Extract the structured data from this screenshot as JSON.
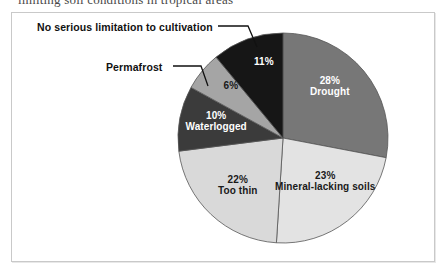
{
  "caption": {
    "cut_off_line": "limiting soil conditions in tropical areas"
  },
  "chart_data": {
    "type": "pie",
    "title": "",
    "subtitle": "",
    "xlabel": "",
    "ylabel": "",
    "legend_position": "none",
    "grid": false,
    "units": "percent",
    "start_angle_deg": 0,
    "direction": "clockwise",
    "categories": [
      "Drought",
      "Mineral-lacking soils",
      "Too thin",
      "Waterlogged",
      "Permafrost",
      "No serious limitation to cultivation"
    ],
    "values": [
      28,
      23,
      22,
      10,
      6,
      11
    ],
    "slices": [
      {
        "name": "Drought",
        "value": 28,
        "percent_text": "28%",
        "label_text": "Drought",
        "label_placement": "inside",
        "text_color": "on-dark",
        "color": "#777777",
        "label_x": 330,
        "label_y": 86
      },
      {
        "name": "Mineral-lacking soils",
        "value": 23,
        "percent_text": "23%",
        "label_text": "Mineral-lacking soils",
        "label_placement": "inside",
        "text_color": "on-light",
        "color": "#e3e3e3",
        "label_x": 325,
        "label_y": 181
      },
      {
        "name": "Too thin",
        "value": 22,
        "percent_text": "22%",
        "label_text": "Too thin",
        "label_placement": "inside",
        "text_color": "on-light",
        "color": "#d9d9d9",
        "label_x": 238,
        "label_y": 185
      },
      {
        "name": "Waterlogged",
        "value": 10,
        "percent_text": "10%",
        "label_text": "Waterlogged",
        "label_placement": "inside",
        "text_color": "on-dark",
        "color": "#3b3b3b",
        "label_x": 216,
        "label_y": 121
      },
      {
        "name": "Permafrost",
        "value": 6,
        "percent_text": "6%",
        "label_text": "",
        "label_placement": "inside-percent-callout-name",
        "text_color": "on-light",
        "color": "#a5a5a5",
        "label_x": 231,
        "label_y": 86
      },
      {
        "name": "No serious limitation to cultivation",
        "value": 11,
        "percent_text": "11%",
        "label_text": "",
        "label_placement": "inside-percent-callout-name",
        "text_color": "on-dark",
        "color": "#161616",
        "label_x": 264,
        "label_y": 62
      }
    ],
    "callouts": [
      {
        "name": "no-serious-limitation",
        "text": "No serious limitation to cultivation",
        "text_x": 37,
        "text_y": 21,
        "line": {
          "x1": 218,
          "y1": 26,
          "x2": 248,
          "y2": 26,
          "x3": 257,
          "y3": 47
        }
      },
      {
        "name": "permafrost",
        "text": "Permafrost",
        "text_x": 106,
        "text_y": 61,
        "line": {
          "x1": 173,
          "y1": 66,
          "x2": 201,
          "y2": 66,
          "x3": 208,
          "y3": 86
        }
      }
    ],
    "geometry": {
      "center_x": 283,
      "center_y": 138,
      "radius": 105
    },
    "colors": {
      "outline": "#555555",
      "background": "#ffffff",
      "frame": "#c9c9c9"
    }
  }
}
